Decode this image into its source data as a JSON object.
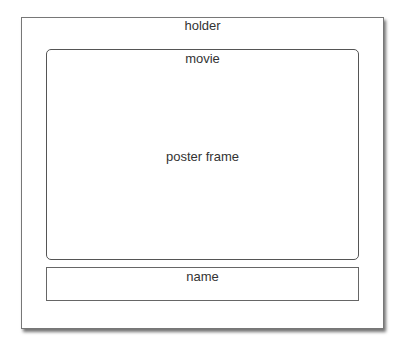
{
  "holder": {
    "label": "holder",
    "movie": {
      "label": "movie",
      "poster_frame_label": "poster frame"
    },
    "name": {
      "label": "name"
    }
  }
}
